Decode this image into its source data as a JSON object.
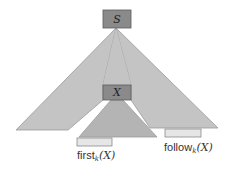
{
  "diagram": {
    "nodes": {
      "root": {
        "label": "S"
      },
      "inner": {
        "label": "X"
      }
    },
    "labels": {
      "first": {
        "text": "first",
        "sub": "k",
        "arg": "(X)"
      },
      "follow": {
        "text": "follow",
        "sub": "k",
        "arg": "(X)"
      }
    },
    "colors": {
      "tree_fill": "#c4c4c4",
      "tree_stroke": "#9a9a9a",
      "node_fill": "#8a8a8a",
      "node_stroke": "#5a5a5a",
      "inner_tree_fill": "#b4b4b4",
      "bar_fill": "#e6e6e6",
      "bar_stroke": "#8a8a8a"
    }
  }
}
